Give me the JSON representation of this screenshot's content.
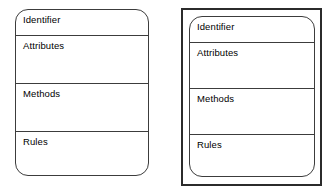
{
  "diagram": {
    "type": "uml-class-boxes",
    "background_color": "#ffffff",
    "stroke_color": "#3c3c3c",
    "frame_stroke_color": "#2b2b2b",
    "text_color": "#000000",
    "shapes": [
      {
        "id": "left",
        "name": "class-box-plain",
        "has_outer_boundary": false,
        "corner_style": "rounded",
        "compartments": [
          {
            "key": "identifier",
            "label": "Identifier"
          },
          {
            "key": "attributes",
            "label": "Attributes"
          },
          {
            "key": "methods",
            "label": "Methods"
          },
          {
            "key": "rules",
            "label": "Rules"
          }
        ]
      },
      {
        "id": "right",
        "name": "class-box-framed",
        "has_outer_boundary": true,
        "corner_style": "rounded",
        "compartments": [
          {
            "key": "identifier",
            "label": "Identifier"
          },
          {
            "key": "attributes",
            "label": "Attributes"
          },
          {
            "key": "methods",
            "label": "Methods"
          },
          {
            "key": "rules",
            "label": "Rules"
          }
        ]
      }
    ]
  }
}
